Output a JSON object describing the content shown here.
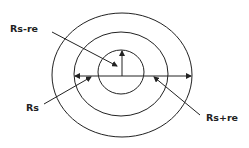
{
  "diagram": {
    "type": "concentric-circles",
    "stroke_color": "#222222",
    "background": "#ffffff",
    "circles": [
      {
        "name": "inner",
        "cx": 121,
        "cy": 72,
        "rx": 23,
        "ry": 22
      },
      {
        "name": "middle",
        "cx": 121,
        "cy": 74,
        "rx": 47,
        "ry": 42
      },
      {
        "name": "outer",
        "cx": 122,
        "cy": 75,
        "rx": 70,
        "ry": 62
      }
    ],
    "labels": {
      "rs_minus_re": "Rs-re",
      "rs": "Rs",
      "rs_plus_re": "Rs+re"
    }
  }
}
